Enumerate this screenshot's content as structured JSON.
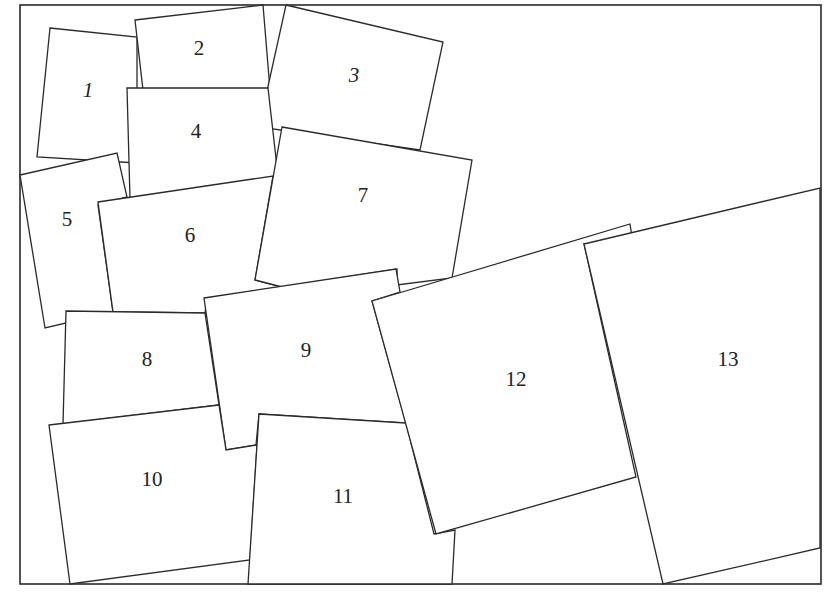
{
  "diagram": {
    "type": "overlapping-squares-puzzle",
    "frame": {
      "x1": 20,
      "y1": 5,
      "x2": 821,
      "y2": 584
    },
    "squares": [
      {
        "id": 1,
        "label": "1",
        "italic": true,
        "points": "50,28 137,37 137,163 37,157",
        "label_pos": [
          88,
          92
        ]
      },
      {
        "id": 2,
        "label": "2",
        "italic": false,
        "points": "135,20 263,5 270,90 143,90",
        "label_pos": [
          199,
          50
        ]
      },
      {
        "id": 3,
        "label": "3",
        "italic": true,
        "points": "286,5 443,42 420,150 259,127",
        "label_pos": [
          354,
          77
        ]
      },
      {
        "id": 4,
        "label": "4",
        "italic": false,
        "points": "127,88 268,88 278,176 130,199",
        "label_pos": [
          196,
          133
        ]
      },
      {
        "id": 5,
        "label": "5",
        "italic": false,
        "points": "20,175 117,153 127,197 98,205 113,312 45,328",
        "label_pos": [
          67,
          221
        ]
      },
      {
        "id": 6,
        "label": "6",
        "italic": false,
        "points": "98,202 273,176 255,280 282,287 207,298 205,313 113,312",
        "label_pos": [
          190,
          237
        ]
      },
      {
        "id": 7,
        "label": "7",
        "italic": false,
        "points": "282,127 472,160 452,278 397,285 397,269 282,287 255,280",
        "label_pos": [
          363,
          197
        ]
      },
      {
        "id": 8,
        "label": "8",
        "italic": false,
        "points": "66,311 205,313 219,405 63,424",
        "label_pos": [
          147,
          361
        ]
      },
      {
        "id": 9,
        "label": "9",
        "italic": false,
        "points": "204,298 396,269 400,292 372,301 406,423 259,414 256,445 226,450",
        "label_pos": [
          306,
          352
        ]
      },
      {
        "id": 10,
        "label": "10",
        "italic": false,
        "points": "49,425 219,405 226,450 257,445 250,560 70,584",
        "label_pos": [
          152,
          481
        ]
      },
      {
        "id": 11,
        "label": "11",
        "italic": false,
        "points": "259,414 406,423 434,534 455,530 452,584 248,584",
        "label_pos": [
          343,
          498
        ]
      },
      {
        "id": 12,
        "label": "12",
        "italic": false,
        "points": "372,301 630,224 633,244 584,244 636,477 436,534",
        "label_pos": [
          516,
          381
        ]
      },
      {
        "id": 13,
        "label": "13",
        "italic": false,
        "points": "584,244 820,188 820,548 663,584",
        "label_pos": [
          728,
          361
        ]
      }
    ],
    "label_color": "#222222",
    "stroke_color": "#2a2a2a",
    "fill_color": "#ffffff"
  }
}
